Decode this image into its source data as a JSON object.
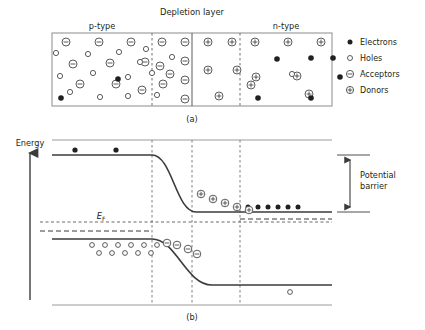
{
  "figure": {
    "title": "Depletion layer",
    "panels": [
      {
        "id": "a",
        "caption": "(a)"
      },
      {
        "id": "b",
        "caption": "(b)"
      }
    ]
  },
  "panel_a": {
    "title": "Depletion layer",
    "region_labels": {
      "left": "p-type",
      "right": "n-type"
    },
    "legend": {
      "items": [
        {
          "symbol": "filled-circle",
          "label": "Electrons"
        },
        {
          "symbol": "open-circle",
          "label": "Holes"
        },
        {
          "symbol": "circled-minus",
          "label": "Acceptors"
        },
        {
          "symbol": "circled-plus",
          "label": "Donors"
        }
      ]
    },
    "box": {
      "x": 52,
      "y": 33,
      "width": 280,
      "height": 73
    },
    "boundaries": {
      "depletion_left_dashed_x": 152,
      "junction_solid_x": 192,
      "depletion_right_dashed_x": 240
    },
    "acceptors": [
      [
        66,
        42
      ],
      [
        99,
        42
      ],
      [
        131,
        42
      ],
      [
        162,
        42
      ],
      [
        73,
        64
      ],
      [
        110,
        63
      ],
      [
        145,
        62
      ],
      [
        160,
        66
      ],
      [
        80,
        84
      ],
      [
        116,
        84
      ],
      [
        163,
        84
      ],
      [
        142,
        90
      ],
      [
        170,
        74
      ],
      [
        185,
        42
      ],
      [
        185,
        61
      ],
      [
        185,
        80
      ],
      [
        185,
        99
      ]
    ],
    "holes": [
      [
        56,
        53
      ],
      [
        88,
        54
      ],
      [
        119,
        52
      ],
      [
        146,
        49
      ],
      [
        60,
        76
      ],
      [
        93,
        73
      ],
      [
        128,
        77
      ],
      [
        152,
        73
      ],
      [
        70,
        92
      ],
      [
        100,
        97
      ],
      [
        128,
        96
      ],
      [
        157,
        95
      ],
      [
        172,
        57
      ],
      [
        140,
        62
      ]
    ],
    "electrons_p": [
      [
        118,
        79
      ],
      [
        61,
        98
      ]
    ],
    "donors": [
      [
        208,
        42
      ],
      [
        232,
        42
      ],
      [
        208,
        70
      ],
      [
        237,
        70
      ],
      [
        219,
        96
      ],
      [
        255,
        42
      ],
      [
        288,
        42
      ],
      [
        321,
        42
      ],
      [
        256,
        77
      ],
      [
        297,
        76
      ],
      [
        251,
        85
      ],
      [
        309,
        94
      ]
    ],
    "electrons_n": [
      [
        277,
        59
      ],
      [
        311,
        58
      ],
      [
        333,
        58
      ],
      [
        340,
        77
      ],
      [
        258,
        98
      ],
      [
        311,
        98
      ]
    ],
    "holes_n": [
      [
        292,
        74
      ]
    ]
  },
  "panel_b": {
    "caption": "(b)",
    "axis_label": "Energy",
    "fermi_label": "E",
    "fermi_label_sub": "F",
    "annotation": {
      "label_line1": "Potential",
      "label_line2": "barrier"
    },
    "frame": {
      "left": 52,
      "right": 332,
      "top": 140,
      "bottom": 305
    },
    "boundaries": {
      "depletion_left_dashed_x": 152,
      "junction_dashed_x": 192,
      "depletion_right_dashed_x": 240
    },
    "conduction_band": {
      "p_level_y": 155,
      "n_level_y": 212,
      "p_flat_end_x": 152,
      "n_flat_start_x": 240
    },
    "valence_band": {
      "p_level_y": 239,
      "n_level_y": 285,
      "p_flat_end_x": 152,
      "n_flat_start_x": 240
    },
    "fermi_level_y": 222,
    "electrons_p_side": [
      [
        75,
        150
      ],
      [
        116,
        150
      ]
    ],
    "electrons_n_side": [
      [
        248,
        207
      ],
      [
        258,
        207
      ],
      [
        268,
        207
      ],
      [
        278,
        207
      ],
      [
        288,
        207
      ],
      [
        298,
        207
      ]
    ],
    "donors_on_slope": [
      [
        201,
        194
      ],
      [
        213,
        199
      ],
      [
        225,
        203
      ],
      [
        237,
        207
      ],
      [
        249,
        210
      ]
    ],
    "acceptors_on_slope": [
      [
        167,
        243
      ],
      [
        177,
        245
      ],
      [
        188,
        249
      ],
      [
        197,
        254
      ]
    ],
    "holes_p_side_row1": [
      [
        92,
        245
      ],
      [
        105,
        245
      ],
      [
        118,
        245
      ],
      [
        131,
        245
      ],
      [
        144,
        245
      ],
      [
        157,
        245
      ]
    ],
    "holes_p_side_row2": [
      [
        99,
        253
      ],
      [
        112,
        253
      ],
      [
        125,
        253
      ],
      [
        138,
        253
      ],
      [
        151,
        253
      ]
    ],
    "holes_n_side": [
      [
        290,
        292
      ]
    ]
  },
  "colors": {
    "ink": "#231f20",
    "band_line": "#3b3b3b",
    "frame_line": "#8c8c8c",
    "background": "#ffffff"
  }
}
